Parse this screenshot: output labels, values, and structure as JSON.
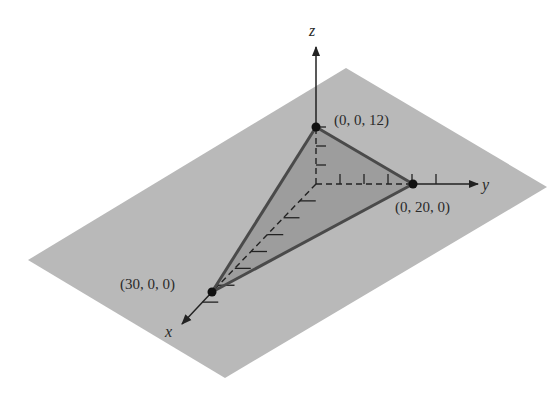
{
  "diagram": {
    "type": "3d-plane-intercepts",
    "axes": {
      "x_label": "x",
      "y_label": "y",
      "z_label": "z"
    },
    "points": [
      {
        "id": "x-intercept",
        "label": "(30, 0, 0)",
        "coords": [
          30,
          0,
          0
        ]
      },
      {
        "id": "y-intercept",
        "label": "(0, 20, 0)",
        "coords": [
          0,
          20,
          0
        ]
      },
      {
        "id": "z-intercept",
        "label": "(0, 0, 12)",
        "coords": [
          0,
          0,
          12
        ]
      }
    ],
    "tick_counts": {
      "x": 7,
      "y": 5,
      "z": 3
    },
    "colors": {
      "plane": "#b9b9b9",
      "triangle": "#9d9d9d",
      "edges": "#4a4a4a",
      "axes": "#222222",
      "points": "#111111"
    }
  }
}
